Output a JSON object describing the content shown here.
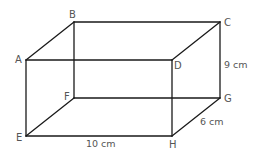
{
  "figure": {
    "type": "cuboid",
    "vertices": {
      "A": {
        "label": "A",
        "x": 26,
        "y": 60
      },
      "B": {
        "label": "B",
        "x": 74,
        "y": 22
      },
      "C": {
        "label": "C",
        "x": 220,
        "y": 22
      },
      "D": {
        "label": "D",
        "x": 172,
        "y": 60
      },
      "E": {
        "label": "E",
        "x": 26,
        "y": 136
      },
      "F": {
        "label": "F",
        "x": 74,
        "y": 98
      },
      "G": {
        "label": "G",
        "x": 220,
        "y": 98
      },
      "H": {
        "label": "H",
        "x": 172,
        "y": 136
      }
    },
    "edges": [
      [
        "A",
        "B"
      ],
      [
        "B",
        "C"
      ],
      [
        "C",
        "D"
      ],
      [
        "D",
        "A"
      ],
      [
        "E",
        "F"
      ],
      [
        "F",
        "G"
      ],
      [
        "G",
        "H"
      ],
      [
        "H",
        "E"
      ],
      [
        "A",
        "E"
      ],
      [
        "B",
        "F"
      ],
      [
        "C",
        "G"
      ],
      [
        "D",
        "H"
      ]
    ],
    "dimensions": {
      "height": "9 cm",
      "length": "10 cm",
      "width": "6 cm"
    },
    "colors": {
      "edge": "#1a1a1a",
      "text": "#555555",
      "background": "#ffffff"
    }
  }
}
